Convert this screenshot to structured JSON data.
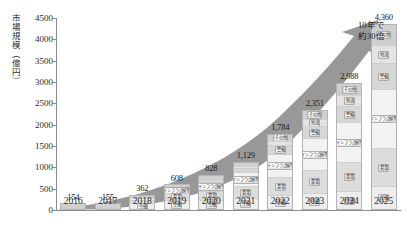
{
  "chart_data": {
    "type": "bar",
    "title": "",
    "xlabel": "",
    "ylabel": "市場規模（億円）",
    "ylim": [
      0,
      4500
    ],
    "yticks": [
      "0",
      "500",
      "1000",
      "1500",
      "2000",
      "2500",
      "3000",
      "3500",
      "4000",
      "4500"
    ],
    "categories": [
      "2016",
      "2017",
      "2018",
      "2019",
      "2020",
      "2021",
      "2022",
      "2023",
      "2024",
      "2025"
    ],
    "values": [
      154,
      155,
      362,
      608,
      828,
      1129,
      1784,
      2351,
      2988,
      4360
    ],
    "value_labels": [
      "154",
      "155",
      "362",
      "608",
      "828",
      "1,129",
      "1,784",
      "2,351",
      "2,988",
      "4,360"
    ],
    "grid": false,
    "legend": "none",
    "stack_labels": [
      "空撮",
      "農業",
      "インフラ点検等",
      "警備",
      "物流",
      "その他"
    ],
    "stacks": [
      {
        "year": "2016",
        "segments": [
          {
            "label": "空撮",
            "value": 90
          },
          {
            "label": "農業",
            "value": 40
          },
          {
            "label": "インフラ点検等",
            "value": 14
          },
          {
            "label": "警備",
            "value": 5
          },
          {
            "label": "物流",
            "value": 2
          },
          {
            "label": "その他",
            "value": 3
          }
        ]
      },
      {
        "year": "2017",
        "segments": [
          {
            "label": "空撮",
            "value": 82
          },
          {
            "label": "農業",
            "value": 44
          },
          {
            "label": "インフラ点検等",
            "value": 17
          },
          {
            "label": "警備",
            "value": 6
          },
          {
            "label": "物流",
            "value": 2
          },
          {
            "label": "その他",
            "value": 4
          }
        ]
      },
      {
        "year": "2018",
        "segments": [
          {
            "label": "空撮",
            "value": 150
          },
          {
            "label": "農業",
            "value": 110
          },
          {
            "label": "インフラ点検等",
            "value": 60
          },
          {
            "label": "警備",
            "value": 20
          },
          {
            "label": "物流",
            "value": 8
          },
          {
            "label": "その他",
            "value": 14
          }
        ]
      },
      {
        "year": "2019",
        "segments": [
          {
            "label": "空撮",
            "value": 200
          },
          {
            "label": "農業",
            "value": 180
          },
          {
            "label": "インフラ点検等",
            "value": 130
          },
          {
            "label": "警備",
            "value": 50
          },
          {
            "label": "物流",
            "value": 18
          },
          {
            "label": "その他",
            "value": 30
          }
        ]
      },
      {
        "year": "2020",
        "segments": [
          {
            "label": "空撮",
            "value": 230
          },
          {
            "label": "農業",
            "value": 230
          },
          {
            "label": "インフラ点検等",
            "value": 215
          },
          {
            "label": "警備",
            "value": 75
          },
          {
            "label": "物流",
            "value": 28
          },
          {
            "label": "その他",
            "value": 50
          }
        ]
      },
      {
        "year": "2021",
        "segments": [
          {
            "label": "空撮",
            "value": 265
          },
          {
            "label": "農業",
            "value": 300
          },
          {
            "label": "インフラ点検等",
            "value": 330
          },
          {
            "label": "警備",
            "value": 115
          },
          {
            "label": "物流",
            "value": 44
          },
          {
            "label": "その他",
            "value": 75
          }
        ]
      },
      {
        "year": "2022",
        "segments": [
          {
            "label": "空撮",
            "value": 330
          },
          {
            "label": "農業",
            "value": 450
          },
          {
            "label": "インフラ点検等",
            "value": 560
          },
          {
            "label": "警備",
            "value": 200
          },
          {
            "label": "物流",
            "value": 100
          },
          {
            "label": "その他",
            "value": 144
          }
        ]
      },
      {
        "year": "2023",
        "segments": [
          {
            "label": "空撮",
            "value": 380
          },
          {
            "label": "農業",
            "value": 560
          },
          {
            "label": "インフラ点検等",
            "value": 760
          },
          {
            "label": "警備",
            "value": 290
          },
          {
            "label": "物流",
            "value": 155
          },
          {
            "label": "その他",
            "value": 206
          }
        ]
      },
      {
        "year": "2024",
        "segments": [
          {
            "label": "空撮",
            "value": 430
          },
          {
            "label": "農業",
            "value": 680
          },
          {
            "label": "インフラ点検等",
            "value": 960
          },
          {
            "label": "警備",
            "value": 390
          },
          {
            "label": "物流",
            "value": 245
          },
          {
            "label": "その他",
            "value": 283
          }
        ]
      },
      {
        "year": "2025",
        "segments": [
          {
            "label": "空撮",
            "value": 540
          },
          {
            "label": "農業",
            "value": 900
          },
          {
            "label": "インフラ点検等",
            "value": 1400
          },
          {
            "label": "警備",
            "value": 620
          },
          {
            "label": "物流",
            "value": 420
          },
          {
            "label": "その他",
            "value": 480
          }
        ]
      }
    ],
    "annotation": {
      "line1": "10年で",
      "line2": "約30倍"
    },
    "colors": {
      "arrow": "#8a8a8a",
      "bar_fill": "#e8e8e8",
      "bar_fill_alt": "#d2d2d2",
      "axis": "#8c8c8c",
      "text": "#1a1a1a"
    }
  }
}
